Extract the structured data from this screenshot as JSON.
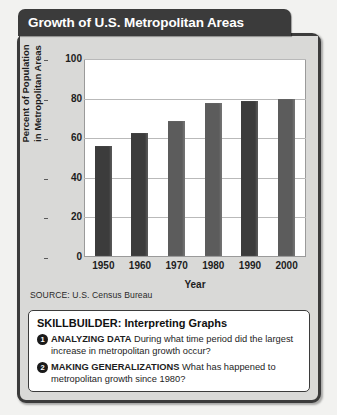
{
  "header": {
    "title": "Growth of U.S. Metropolitan Areas"
  },
  "chart_data": {
    "type": "bar",
    "title": "Growth of U.S. Metropolitan Areas",
    "categories": [
      "1950",
      "1960",
      "1970",
      "1980",
      "1990",
      "2000"
    ],
    "values": [
      56,
      63,
      69,
      78,
      79,
      80
    ],
    "xlabel": "Year",
    "ylabel_line1": "Percent of Population",
    "ylabel_line2": "in Metropolitan Areas",
    "ylim": [
      0,
      100
    ],
    "yticks": [
      "100",
      "80",
      "60",
      "40",
      "20",
      "0"
    ],
    "grid": true,
    "legend": "none",
    "bar_colors": [
      "#3c3c3c",
      "#3c3c3c",
      "#5c5c5c",
      "#5c5c5c",
      "#3c3c3c",
      "#5c5c5c"
    ],
    "source": "SOURCE: U.S. Census Bureau"
  },
  "skillbuilder": {
    "title": "SKILLBUILDER: Interpreting Graphs",
    "items": [
      {
        "number": "❶",
        "label": "ANALYZING DATA",
        "question": " During what time period did the largest increase in metropolitan growth occur?"
      },
      {
        "number": "❷",
        "label": "MAKING GENERALIZATIONS",
        "question": " What has happened to metropolitan growth since 1980?"
      }
    ]
  }
}
